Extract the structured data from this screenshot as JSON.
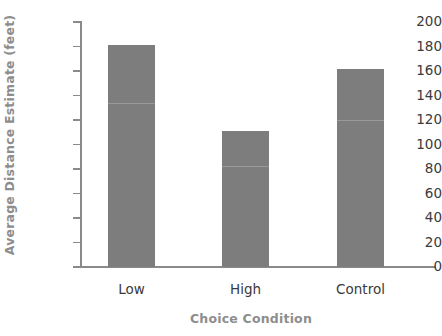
{
  "chart_data": {
    "type": "bar",
    "title": "",
    "xlabel": "Choice Condition",
    "ylabel": "Average Distance Estimate (feet)",
    "categories": [
      "Low",
      "High",
      "Control"
    ],
    "values": [
      181,
      111,
      162
    ],
    "ylim": [
      0,
      200
    ],
    "yticks": [
      0,
      20,
      40,
      60,
      80,
      100,
      120,
      140,
      160,
      180,
      200
    ],
    "ytick_labels": [
      "0",
      "20",
      "40",
      "60",
      "80",
      "100",
      "120",
      "140",
      "160",
      "180",
      "200"
    ],
    "grid": false,
    "legend": false,
    "bar_color": "#7d7d7d",
    "axis_color": "#8a8a8a",
    "axis_title_color": "#8d8d8d",
    "tick_label_color": "#3a3a3a",
    "background": "#ffffff"
  }
}
